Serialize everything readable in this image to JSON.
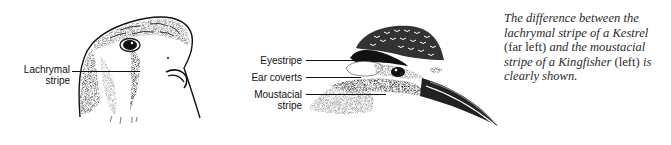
{
  "figure_left": {
    "subject": "Kestrel head",
    "labels": [
      {
        "line1": "Lachrymal",
        "line2": "stripe"
      }
    ]
  },
  "figure_right": {
    "subject": "Kingfisher head",
    "labels": [
      {
        "text": "Eyestripe"
      },
      {
        "text": "Ear coverts"
      },
      {
        "line1": "Moustacial",
        "line2": "stripe"
      }
    ]
  },
  "caption": {
    "part1": "The difference between the lachrymal stripe of a Kestrel ",
    "part2": "(far left)",
    "part3": " and the moustacial stripe of a Kingfisher ",
    "part4": "(left)",
    "part5": " is clearly shown."
  }
}
